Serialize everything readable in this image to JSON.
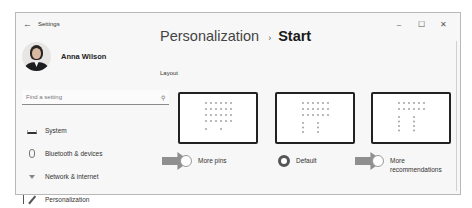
{
  "window": {
    "title": "Settings",
    "back_icon": "←",
    "controls": {
      "minimize": "–",
      "maximize": "☐",
      "close": "✕"
    }
  },
  "profile": {
    "name": "Anna Wilson"
  },
  "search": {
    "placeholder": "Find a setting",
    "icon": "⚲"
  },
  "sidebar": {
    "items": [
      {
        "label": "System",
        "icon": "system-icon",
        "active": false
      },
      {
        "label": "Bluetooth & devices",
        "icon": "bluetooth-icon",
        "active": false
      },
      {
        "label": "Network & internet",
        "icon": "network-icon",
        "active": false
      },
      {
        "label": "Personalization",
        "icon": "personalization-icon",
        "active": true
      }
    ]
  },
  "main": {
    "breadcrumb": {
      "parent": "Personalization",
      "separator": "›",
      "current": "Start"
    },
    "section_label": "Layout",
    "layout_options": [
      {
        "label": "More pins",
        "selected": false,
        "highlighted_by_arrow": true,
        "pin_rows": 4,
        "rec_rows": 1
      },
      {
        "label": "Default",
        "selected": true,
        "highlighted_by_arrow": false,
        "pin_rows": 3,
        "rec_rows": 3
      },
      {
        "label": "More recommendations",
        "label_lines": [
          "More",
          "recommendations"
        ],
        "selected": false,
        "highlighted_by_arrow": true,
        "pin_rows": 2,
        "rec_rows": 4
      }
    ]
  },
  "colors": {
    "window_bg": "#f7f7f7",
    "arrow": "#8f8f8f",
    "preview_border": "#222222",
    "dot": "#999999"
  }
}
